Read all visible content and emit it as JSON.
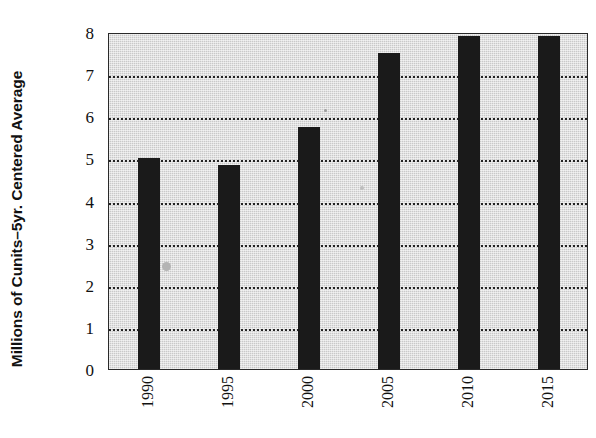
{
  "chart_data": {
    "type": "bar",
    "title": "",
    "subtitle": "",
    "xlabel": "",
    "ylabel": "Millions of Cunits–5yr. Centered Average",
    "categories": [
      "1990",
      "1995",
      "2000",
      "2005",
      "2010",
      "2015"
    ],
    "values": [
      5.0,
      4.85,
      5.75,
      7.5,
      7.9,
      7.9
    ],
    "series": [
      {
        "name": "Millions of Cunits–5yr. Centered Average",
        "values": [
          5.0,
          4.85,
          5.75,
          7.5,
          7.9,
          7.9
        ]
      }
    ],
    "ylim": [
      0,
      8
    ],
    "y_ticks": [
      "0",
      "1",
      "2",
      "3",
      "4",
      "5",
      "6",
      "7",
      "8"
    ],
    "y_tick_values": [
      0,
      1,
      2,
      3,
      4,
      5,
      6,
      7,
      8
    ],
    "gridlines": [
      1,
      2,
      3,
      4,
      5,
      6,
      7
    ],
    "grid": true,
    "grid_style": "dotted",
    "legend": null,
    "legend_position": "none",
    "annotations": [],
    "colors": {
      "bar": "#1a1a1a",
      "plot_background": "#c9c9c9",
      "figure_background": "#ffffff",
      "gridline": "#1a1a1a",
      "axis": "#2a2a2a",
      "text": "#111111"
    },
    "x_tick_rotation": -90,
    "bar_orientation": "vertical"
  }
}
